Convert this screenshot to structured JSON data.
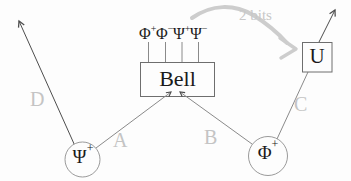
{
  "diagram": {
    "title_hidden": "",
    "bell_box": {
      "label": "Bell"
    },
    "unitary_box": {
      "label": "U"
    },
    "bell_outcomes": [
      {
        "base": "Φ",
        "sup": "+"
      },
      {
        "base": "Φ",
        "sup": "−"
      },
      {
        "base": "Ψ",
        "sup": "+"
      },
      {
        "base": "Ψ",
        "sup": "−"
      }
    ],
    "left_source": {
      "base": "Ψ",
      "sup": "+"
    },
    "right_source": {
      "base": "Φ",
      "sup": "+"
    },
    "edge_labels": {
      "a": "A",
      "b": "B",
      "c": "C",
      "d": "D"
    },
    "classical_channel": {
      "label": "2 bits"
    },
    "colors": {
      "quantum_line": "#4d4d4d",
      "box_stroke": "#6e6e6e",
      "circle_stroke": "#9a9a9a",
      "faded_label": "#c4c4c4",
      "classical_arrow": "#cdcdcd",
      "text": "#1a1a1a",
      "background": "#fdfdfd"
    }
  }
}
